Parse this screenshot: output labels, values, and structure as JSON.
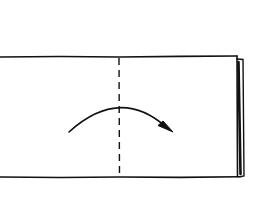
{
  "diagram": {
    "type": "origami-fold-step",
    "colors": {
      "background": "#ffffff",
      "ink": "#111111"
    },
    "paper": {
      "x": 0,
      "y": 56,
      "width": 237,
      "height": 121
    },
    "fold_line": {
      "style": "dashed",
      "x": 119,
      "y1": 57,
      "y2": 177,
      "label": "valley fold"
    },
    "arrow": {
      "from": [
        69,
        132
      ],
      "peak": [
        120,
        108
      ],
      "to": [
        173,
        132
      ],
      "direction": "left-to-right"
    },
    "folded_edge": {
      "x": 236,
      "layers": 2
    }
  }
}
